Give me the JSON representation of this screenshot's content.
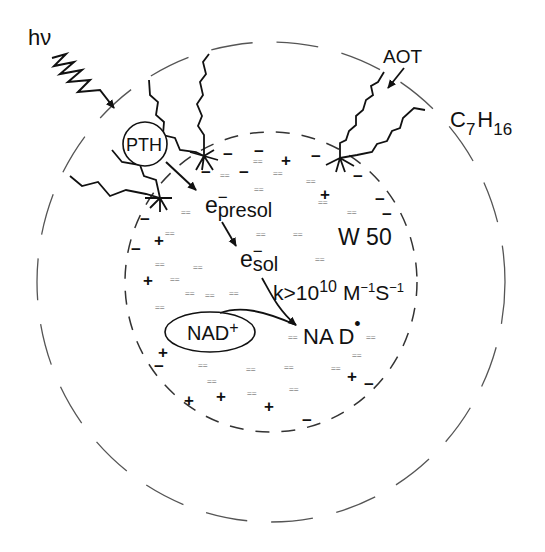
{
  "diagram": {
    "type": "reverse micelle schematic",
    "labels": {
      "light": "hν",
      "photosensitizer": "PTH",
      "surfactant": "AOT",
      "solvent_main": "C",
      "solvent_sub7": "7",
      "solvent_H": "H",
      "solvent_sub16": "16",
      "presolvated_e": "e",
      "presolvated_sup": "−",
      "presolvated_sub": "presol",
      "solvated_e": "e",
      "solvated_sup": "−",
      "solvated_sub": "sol",
      "water_pool": "W 50",
      "rate_k": "k>10",
      "rate_exp": "10",
      "rate_M": "M",
      "rate_M_exp": "−1",
      "rate_S": "S",
      "rate_S_exp": "−1",
      "substrate": "NAD",
      "substrate_sup": "+",
      "product": "NA D",
      "product_sup": "•"
    },
    "water_marker": "==",
    "plus": "+",
    "minus": "−",
    "colors": {
      "ink": "#111111",
      "dashes": "#555555",
      "water": "#888888",
      "background": "#ffffff"
    }
  }
}
